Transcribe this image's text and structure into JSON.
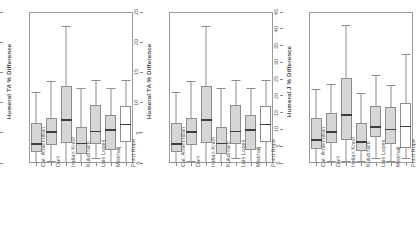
{
  "figure": {
    "categories": [
      "Cal. Amerindian",
      "Dart",
      "Indian Knoll",
      "Kulubnarti",
      "Luis Lopes",
      "Mistihalj",
      "Point Hope"
    ],
    "fill_color": "#d6d6d6",
    "empty_fill_color": "#ffffff",
    "line_color": "#8d8d8d",
    "median_color": "#3d3d3d"
  },
  "chart_data": [
    {
      "type": "box",
      "panel_index": 1,
      "title": "",
      "xlabel": "",
      "ylabel": "Humeral TA % Difference",
      "ylim": [
        0,
        25
      ],
      "yticks": [
        0,
        5,
        10,
        15,
        20,
        25
      ],
      "grid": false,
      "legend": "none",
      "categories": [
        "Cal. Amerindian",
        "Dart",
        "Indian Knoll",
        "Kulubnarti",
        "Luis Lopes",
        "Mistihalj",
        "Point Hope"
      ],
      "boxes": [
        {
          "label": "Cal. Amerindian",
          "whisker_low": 0.1,
          "q1": 1.9,
          "median": 3.1,
          "q3": 6.6,
          "whisker_high": 11.7,
          "filled": true
        },
        {
          "label": "Dart",
          "whisker_low": 0.4,
          "q1": 2.9,
          "median": 5.1,
          "q3": 7.5,
          "whisker_high": 13.6,
          "filled": true
        },
        {
          "label": "Indian Knoll",
          "whisker_low": 0.1,
          "q1": 3.3,
          "median": 7.1,
          "q3": 12.7,
          "whisker_high": 22.6,
          "filled": true
        },
        {
          "label": "Kulubnarti",
          "whisker_low": 0.2,
          "q1": 1.5,
          "median": 3.2,
          "q3": 6.0,
          "whisker_high": 12.5,
          "filled": true
        },
        {
          "label": "Luis Lopes",
          "whisker_low": 0.9,
          "q1": 3.2,
          "median": 5.2,
          "q3": 9.6,
          "whisker_high": 13.7,
          "filled": true
        },
        {
          "label": "Mistihalj",
          "whisker_low": 0.1,
          "q1": 2.2,
          "median": 5.5,
          "q3": 8.0,
          "whisker_high": 12.4,
          "filled": true
        },
        {
          "label": "Point Hope",
          "whisker_low": 0.1,
          "q1": 3.5,
          "median": 6.4,
          "q3": 9.4,
          "whisker_high": 13.7,
          "filled": false
        }
      ]
    },
    {
      "type": "box",
      "panel_index": 2,
      "title": "",
      "xlabel": "",
      "ylabel": "Humeral TA % Difference",
      "ylim": [
        0,
        25
      ],
      "yticks": [
        0,
        5,
        10,
        15,
        20,
        25
      ],
      "grid": false,
      "legend": "none",
      "categories": [
        "Cal. Amerindian",
        "Dart",
        "Indian Knoll",
        "Kulubnarti",
        "Luis Lopes",
        "Mistihalj",
        "Point Hope"
      ],
      "boxes": [
        {
          "label": "Cal. Amerindian",
          "whisker_low": 0.1,
          "q1": 1.9,
          "median": 3.1,
          "q3": 6.6,
          "whisker_high": 11.7,
          "filled": true
        },
        {
          "label": "Dart",
          "whisker_low": 0.4,
          "q1": 2.9,
          "median": 5.1,
          "q3": 7.5,
          "whisker_high": 13.6,
          "filled": true
        },
        {
          "label": "Indian Knoll",
          "whisker_low": 0.1,
          "q1": 3.3,
          "median": 7.1,
          "q3": 12.7,
          "whisker_high": 22.6,
          "filled": true
        },
        {
          "label": "Kulubnarti",
          "whisker_low": 0.2,
          "q1": 1.5,
          "median": 3.2,
          "q3": 6.0,
          "whisker_high": 12.5,
          "filled": true
        },
        {
          "label": "Luis Lopes",
          "whisker_low": 0.9,
          "q1": 3.2,
          "median": 5.2,
          "q3": 9.6,
          "whisker_high": 13.7,
          "filled": true
        },
        {
          "label": "Mistihalj",
          "whisker_low": 0.1,
          "q1": 2.2,
          "median": 5.5,
          "q3": 8.0,
          "whisker_high": 12.4,
          "filled": true
        },
        {
          "label": "Point Hope",
          "whisker_low": 0.1,
          "q1": 3.5,
          "median": 6.4,
          "q3": 9.4,
          "whisker_high": 13.7,
          "filled": false
        }
      ]
    },
    {
      "type": "box",
      "panel_index": 3,
      "title": "",
      "xlabel": "",
      "ylabel": "Humeral J % Difference",
      "ylim": [
        0,
        45
      ],
      "yticks": [
        0,
        5,
        10,
        15,
        20,
        25,
        30,
        35,
        40,
        45
      ],
      "grid": false,
      "legend": "none",
      "categories": [
        "Cal. Amerindian",
        "Dart",
        "Indian Knoll",
        "Kulubnarti",
        "Luis Lopes",
        "Mistihalj",
        "Point Hope"
      ],
      "boxes": [
        {
          "label": "Cal. Amerindian",
          "whisker_low": 0.4,
          "q1": 4.2,
          "median": 6.8,
          "q3": 13.3,
          "whisker_high": 22.0,
          "filled": true
        },
        {
          "label": "Dart",
          "whisker_low": 0.5,
          "q1": 6.0,
          "median": 9.2,
          "q3": 15.0,
          "whisker_high": 23.6,
          "filled": true
        },
        {
          "label": "Indian Knoll",
          "whisker_low": 0.5,
          "q1": 6.8,
          "median": 14.3,
          "q3": 25.3,
          "whisker_high": 41.2,
          "filled": true
        },
        {
          "label": "Kulubnarti",
          "whisker_low": 0.5,
          "q1": 3.6,
          "median": 6.3,
          "q3": 11.8,
          "whisker_high": 21.0,
          "filled": true
        },
        {
          "label": "Luis Lopes",
          "whisker_low": 1.6,
          "q1": 7.6,
          "median": 10.8,
          "q3": 17.0,
          "whisker_high": 26.3,
          "filled": true
        },
        {
          "label": "Mistihalj",
          "whisker_low": 0.5,
          "q1": 5.8,
          "median": 10.0,
          "q3": 16.6,
          "whisker_high": 23.2,
          "filled": true
        },
        {
          "label": "Point Hope",
          "whisker_low": 1.6,
          "q1": 4.6,
          "median": 10.9,
          "q3": 18.0,
          "whisker_high": 32.4,
          "filled": false
        }
      ]
    }
  ]
}
